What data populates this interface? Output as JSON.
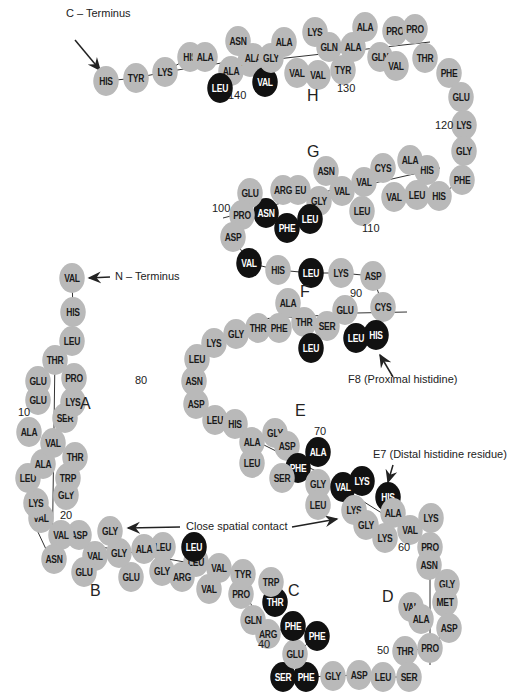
{
  "colors": {
    "residue_grey": "#b9b9b9",
    "residue_black": "#111111",
    "line": "#333333",
    "text": "#222222"
  },
  "annotations": {
    "c_terminus": "C – Terminus",
    "n_terminus": "N – Terminus",
    "proximal": "F8 (Proximal histidine)",
    "distal": "E7 (Distal histidine residue)",
    "contact": "Close spatial contact"
  },
  "helices": [
    {
      "id": "A",
      "x": 80,
      "y": 405
    },
    {
      "id": "B",
      "x": 90,
      "y": 592
    },
    {
      "id": "C",
      "x": 288,
      "y": 592
    },
    {
      "id": "D",
      "x": 382,
      "y": 598
    },
    {
      "id": "E",
      "x": 295,
      "y": 412
    },
    {
      "id": "F",
      "x": 300,
      "y": 293
    },
    {
      "id": "G",
      "x": 307,
      "y": 153
    },
    {
      "id": "H",
      "x": 307,
      "y": 97
    }
  ],
  "numbers": [
    {
      "v": "10",
      "x": 18,
      "y": 413
    },
    {
      "v": "20",
      "x": 60,
      "y": 516
    },
    {
      "v": "40",
      "x": 258,
      "y": 645
    },
    {
      "v": "50",
      "x": 377,
      "y": 651
    },
    {
      "v": "60",
      "x": 398,
      "y": 548
    },
    {
      "v": "70",
      "x": 314,
      "y": 432
    },
    {
      "v": "80",
      "x": 135,
      "y": 381
    },
    {
      "v": "90",
      "x": 350,
      "y": 294
    },
    {
      "v": "100",
      "x": 212,
      "y": 209
    },
    {
      "v": "110",
      "x": 362,
      "y": 229
    },
    {
      "v": "120",
      "x": 435,
      "y": 126
    },
    {
      "v": "130",
      "x": 337,
      "y": 89
    },
    {
      "v": "140",
      "x": 228,
      "y": 96
    }
  ],
  "residues": [
    {
      "n": "HIS",
      "x": 106,
      "y": 81,
      "c": "grey"
    },
    {
      "n": "TYR",
      "x": 136,
      "y": 78,
      "c": "grey"
    },
    {
      "n": "LYS",
      "x": 165,
      "y": 72,
      "c": "grey"
    },
    {
      "n": "HIS",
      "x": 190,
      "y": 57,
      "c": "grey"
    },
    {
      "n": "ALA",
      "x": 205,
      "y": 57,
      "c": "grey"
    },
    {
      "n": "ALA",
      "x": 231,
      "y": 71,
      "c": "grey"
    },
    {
      "n": "LEU",
      "x": 220,
      "y": 88,
      "c": "black"
    },
    {
      "n": "ASN",
      "x": 238,
      "y": 41,
      "c": "grey"
    },
    {
      "n": "ALA",
      "x": 250,
      "y": 62,
      "c": "grey"
    },
    {
      "n": "ALA",
      "x": 253,
      "y": 58,
      "c": "grey"
    },
    {
      "n": "VAL",
      "x": 265,
      "y": 82,
      "c": "black"
    },
    {
      "n": "GLY",
      "x": 271,
      "y": 58,
      "c": "grey"
    },
    {
      "n": "ALA",
      "x": 284,
      "y": 42,
      "c": "grey"
    },
    {
      "n": "VAL",
      "x": 297,
      "y": 73,
      "c": "grey"
    },
    {
      "n": "VAL",
      "x": 318,
      "y": 75,
      "c": "grey"
    },
    {
      "n": "LYS",
      "x": 315,
      "y": 32,
      "c": "grey"
    },
    {
      "n": "GLN",
      "x": 329,
      "y": 47,
      "c": "grey"
    },
    {
      "n": "TYR",
      "x": 343,
      "y": 70,
      "c": "grey"
    },
    {
      "n": "ALA",
      "x": 353,
      "y": 47,
      "c": "grey"
    },
    {
      "n": "ALA",
      "x": 365,
      "y": 27,
      "c": "grey"
    },
    {
      "n": "GLN",
      "x": 380,
      "y": 57,
      "c": "grey"
    },
    {
      "n": "VAL",
      "x": 396,
      "y": 66,
      "c": "grey"
    },
    {
      "n": "PRO",
      "x": 395,
      "y": 31,
      "c": "grey"
    },
    {
      "n": "PRO",
      "x": 415,
      "y": 29,
      "c": "grey"
    },
    {
      "n": "THR",
      "x": 425,
      "y": 58,
      "c": "grey"
    },
    {
      "n": "PHE",
      "x": 449,
      "y": 73,
      "c": "grey"
    },
    {
      "n": "GLU",
      "x": 461,
      "y": 97,
      "c": "grey"
    },
    {
      "n": "LYS",
      "x": 464,
      "y": 125,
      "c": "grey"
    },
    {
      "n": "GLY",
      "x": 464,
      "y": 151,
      "c": "grey"
    },
    {
      "n": "PHE",
      "x": 462,
      "y": 180,
      "c": "grey"
    },
    {
      "n": "HIS",
      "x": 439,
      "y": 196,
      "c": "grey"
    },
    {
      "n": "HIS",
      "x": 427,
      "y": 170,
      "c": "grey"
    },
    {
      "n": "ALA",
      "x": 410,
      "y": 160,
      "c": "grey"
    },
    {
      "n": "LEU",
      "x": 417,
      "y": 195,
      "c": "grey"
    },
    {
      "n": "VAL",
      "x": 394,
      "y": 197,
      "c": "grey"
    },
    {
      "n": "CYS",
      "x": 383,
      "y": 168,
      "c": "grey"
    },
    {
      "n": "VAL",
      "x": 364,
      "y": 182,
      "c": "grey"
    },
    {
      "n": "LEU",
      "x": 362,
      "y": 211,
      "c": "grey"
    },
    {
      "n": "VAL",
      "x": 342,
      "y": 191,
      "c": "grey"
    },
    {
      "n": "ASN",
      "x": 326,
      "y": 171,
      "c": "grey"
    },
    {
      "n": "GLY",
      "x": 319,
      "y": 201,
      "c": "grey"
    },
    {
      "n": "LEU",
      "x": 298,
      "y": 190,
      "c": "grey"
    },
    {
      "n": "ARG",
      "x": 283,
      "y": 190,
      "c": "grey"
    },
    {
      "n": "LEU",
      "x": 310,
      "y": 219,
      "c": "black"
    },
    {
      "n": "PHE",
      "x": 287,
      "y": 228,
      "c": "black"
    },
    {
      "n": "ASN",
      "x": 266,
      "y": 213,
      "c": "black"
    },
    {
      "n": "GLU",
      "x": 250,
      "y": 193,
      "c": "grey"
    },
    {
      "n": "PRO",
      "x": 242,
      "y": 215,
      "c": "grey"
    },
    {
      "n": "ASP",
      "x": 233,
      "y": 237,
      "c": "grey"
    },
    {
      "n": "VAL",
      "x": 249,
      "y": 263,
      "c": "black"
    },
    {
      "n": "HIS",
      "x": 278,
      "y": 270,
      "c": "grey"
    },
    {
      "n": "LEU",
      "x": 311,
      "y": 273,
      "c": "black"
    },
    {
      "n": "LYS",
      "x": 341,
      "y": 273,
      "c": "grey"
    },
    {
      "n": "ASP",
      "x": 373,
      "y": 276,
      "c": "grey"
    },
    {
      "n": "CYS",
      "x": 383,
      "y": 307,
      "c": "grey"
    },
    {
      "n": "HIS",
      "x": 376,
      "y": 335,
      "c": "black"
    },
    {
      "n": "LEU",
      "x": 356,
      "y": 338,
      "c": "black"
    },
    {
      "n": "GLU",
      "x": 345,
      "y": 310,
      "c": "grey"
    },
    {
      "n": "SER",
      "x": 327,
      "y": 326,
      "c": "grey"
    },
    {
      "n": "THR",
      "x": 304,
      "y": 322,
      "c": "grey"
    },
    {
      "n": "LEU",
      "x": 311,
      "y": 348,
      "c": "black"
    },
    {
      "n": "ALA",
      "x": 288,
      "y": 303,
      "c": "grey"
    },
    {
      "n": "PHE",
      "x": 279,
      "y": 328,
      "c": "grey"
    },
    {
      "n": "THR",
      "x": 258,
      "y": 328,
      "c": "grey"
    },
    {
      "n": "GLY",
      "x": 236,
      "y": 334,
      "c": "grey"
    },
    {
      "n": "LYS",
      "x": 214,
      "y": 343,
      "c": "grey"
    },
    {
      "n": "LEU",
      "x": 197,
      "y": 359,
      "c": "grey"
    },
    {
      "n": "ASN",
      "x": 194,
      "y": 381,
      "c": "grey"
    },
    {
      "n": "ASP",
      "x": 196,
      "y": 404,
      "c": "grey"
    },
    {
      "n": "LEU",
      "x": 215,
      "y": 420,
      "c": "grey"
    },
    {
      "n": "HIS",
      "x": 235,
      "y": 424,
      "c": "grey"
    },
    {
      "n": "ALA",
      "x": 252,
      "y": 442,
      "c": "grey"
    },
    {
      "n": "LEU",
      "x": 252,
      "y": 463,
      "c": "grey"
    },
    {
      "n": "GLY",
      "x": 275,
      "y": 433,
      "c": "grey"
    },
    {
      "n": "ASP",
      "x": 287,
      "y": 446,
      "c": "grey"
    },
    {
      "n": "PHE",
      "x": 298,
      "y": 468,
      "c": "black"
    },
    {
      "n": "SER",
      "x": 282,
      "y": 478,
      "c": "grey"
    },
    {
      "n": "ALA",
      "x": 318,
      "y": 452,
      "c": "black"
    },
    {
      "n": "GLY",
      "x": 318,
      "y": 484,
      "c": "grey"
    },
    {
      "n": "LEU",
      "x": 318,
      "y": 505,
      "c": "grey"
    },
    {
      "n": "VAL",
      "x": 343,
      "y": 487,
      "c": "black"
    },
    {
      "n": "LYS",
      "x": 362,
      "y": 481,
      "c": "black"
    },
    {
      "n": "LYS",
      "x": 354,
      "y": 510,
      "c": "grey"
    },
    {
      "n": "GLY",
      "x": 366,
      "y": 525,
      "c": "grey"
    },
    {
      "n": "HIS",
      "x": 388,
      "y": 497,
      "c": "black"
    },
    {
      "n": "ALA",
      "x": 393,
      "y": 513,
      "c": "grey"
    },
    {
      "n": "LYS",
      "x": 385,
      "y": 538,
      "c": "grey"
    },
    {
      "n": "VAL",
      "x": 410,
      "y": 530,
      "c": "grey"
    },
    {
      "n": "LYS",
      "x": 431,
      "y": 518,
      "c": "grey"
    },
    {
      "n": "PRO",
      "x": 430,
      "y": 547,
      "c": "grey"
    },
    {
      "n": "ASN",
      "x": 429,
      "y": 565,
      "c": "grey"
    },
    {
      "n": "GLY",
      "x": 447,
      "y": 584,
      "c": "grey"
    },
    {
      "n": "MET",
      "x": 445,
      "y": 602,
      "c": "grey"
    },
    {
      "n": "VAL",
      "x": 411,
      "y": 607,
      "c": "grey"
    },
    {
      "n": "ALA",
      "x": 421,
      "y": 619,
      "c": "grey"
    },
    {
      "n": "ASP",
      "x": 449,
      "y": 628,
      "c": "grey"
    },
    {
      "n": "PRO",
      "x": 430,
      "y": 648,
      "c": "grey"
    },
    {
      "n": "THR",
      "x": 405,
      "y": 651,
      "c": "grey"
    },
    {
      "n": "SER",
      "x": 409,
      "y": 677,
      "c": "grey"
    },
    {
      "n": "LEU",
      "x": 383,
      "y": 677,
      "c": "grey"
    },
    {
      "n": "ASP",
      "x": 359,
      "y": 675,
      "c": "grey"
    },
    {
      "n": "GLY",
      "x": 333,
      "y": 676,
      "c": "grey"
    },
    {
      "n": "PHE",
      "x": 306,
      "y": 677,
      "c": "black"
    },
    {
      "n": "SER",
      "x": 283,
      "y": 677,
      "c": "black"
    },
    {
      "n": "GLU",
      "x": 295,
      "y": 654,
      "c": "grey"
    },
    {
      "n": "PHE",
      "x": 317,
      "y": 636,
      "c": "black"
    },
    {
      "n": "PHE",
      "x": 293,
      "y": 626,
      "c": "black"
    },
    {
      "n": "ARG",
      "x": 268,
      "y": 634,
      "c": "grey"
    },
    {
      "n": "GLN",
      "x": 253,
      "y": 620,
      "c": "grey"
    },
    {
      "n": "THR",
      "x": 275,
      "y": 602,
      "c": "black"
    },
    {
      "n": "TRP",
      "x": 271,
      "y": 582,
      "c": "grey"
    },
    {
      "n": "PRO",
      "x": 241,
      "y": 594,
      "c": "grey"
    },
    {
      "n": "TYR",
      "x": 243,
      "y": 574,
      "c": "grey"
    },
    {
      "n": "VAL",
      "x": 219,
      "y": 568,
      "c": "grey"
    },
    {
      "n": "VAL",
      "x": 209,
      "y": 589,
      "c": "grey"
    },
    {
      "n": "LEU",
      "x": 196,
      "y": 562,
      "c": "grey"
    },
    {
      "n": "LEU",
      "x": 194,
      "y": 547,
      "c": "black"
    },
    {
      "n": "ARG",
      "x": 182,
      "y": 577,
      "c": "grey"
    },
    {
      "n": "GLY",
      "x": 162,
      "y": 571,
      "c": "grey"
    },
    {
      "n": "LEU",
      "x": 163,
      "y": 547,
      "c": "grey"
    },
    {
      "n": "ALA",
      "x": 144,
      "y": 549,
      "c": "grey"
    },
    {
      "n": "GLU",
      "x": 131,
      "y": 577,
      "c": "grey"
    },
    {
      "n": "GLY",
      "x": 119,
      "y": 553,
      "c": "grey"
    },
    {
      "n": "GLY",
      "x": 110,
      "y": 531,
      "c": "grey"
    },
    {
      "n": "VAL",
      "x": 95,
      "y": 556,
      "c": "grey"
    },
    {
      "n": "GLU",
      "x": 84,
      "y": 572,
      "c": "grey"
    },
    {
      "n": "ASP",
      "x": 79,
      "y": 535,
      "c": "grey"
    },
    {
      "n": "VAL",
      "x": 61,
      "y": 535,
      "c": "grey"
    },
    {
      "n": "ASN",
      "x": 54,
      "y": 559,
      "c": "grey"
    },
    {
      "n": "VAL",
      "x": 41,
      "y": 518,
      "c": "grey"
    },
    {
      "n": "LYS",
      "x": 36,
      "y": 503,
      "c": "grey"
    },
    {
      "n": "GLY",
      "x": 66,
      "y": 495,
      "c": "grey"
    },
    {
      "n": "TRP",
      "x": 68,
      "y": 478,
      "c": "grey"
    },
    {
      "n": "LEU",
      "x": 28,
      "y": 478,
      "c": "grey"
    },
    {
      "n": "ALA",
      "x": 43,
      "y": 464,
      "c": "grey"
    },
    {
      "n": "THR",
      "x": 75,
      "y": 457,
      "c": "grey"
    },
    {
      "n": "VAL",
      "x": 53,
      "y": 443,
      "c": "grey"
    },
    {
      "n": "ALA",
      "x": 29,
      "y": 432,
      "c": "grey"
    },
    {
      "n": "SER",
      "x": 65,
      "y": 418,
      "c": "grey"
    },
    {
      "n": "LYS",
      "x": 73,
      "y": 402,
      "c": "grey"
    },
    {
      "n": "GLU",
      "x": 38,
      "y": 400,
      "c": "grey"
    },
    {
      "n": "GLU",
      "x": 38,
      "y": 381,
      "c": "grey"
    },
    {
      "n": "PRO",
      "x": 74,
      "y": 378,
      "c": "grey"
    },
    {
      "n": "THR",
      "x": 55,
      "y": 360,
      "c": "grey"
    },
    {
      "n": "LEU",
      "x": 72,
      "y": 341,
      "c": "grey"
    },
    {
      "n": "HIS",
      "x": 73,
      "y": 312,
      "c": "grey"
    },
    {
      "n": "VAL",
      "x": 72,
      "y": 278,
      "c": "grey"
    }
  ]
}
